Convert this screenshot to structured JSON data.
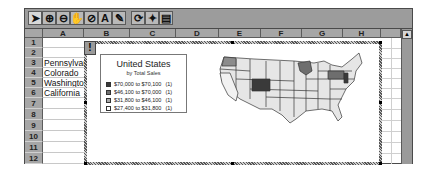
{
  "toolbar": {
    "tools": [
      {
        "name": "select-arrow-icon",
        "glyph": "➤"
      },
      {
        "name": "zoom-in-icon",
        "glyph": "⊕"
      },
      {
        "name": "zoom-out-icon",
        "glyph": "⊖"
      },
      {
        "name": "grabber-hand-icon",
        "glyph": "✋"
      },
      {
        "name": "center-map-icon",
        "glyph": "⊘"
      },
      {
        "name": "text-label-icon",
        "glyph": "A"
      },
      {
        "name": "pin-marker-icon",
        "glyph": "✎"
      },
      {
        "name": "redraw-map-icon",
        "glyph": "⟳"
      },
      {
        "name": "map-refresh-icon",
        "glyph": "✦"
      },
      {
        "name": "show-control-panel-icon",
        "glyph": "▤"
      }
    ]
  },
  "grid": {
    "columns": [
      "A",
      "B",
      "C",
      "D",
      "E",
      "F",
      "G",
      "H"
    ],
    "rows": [
      "1",
      "2",
      "3",
      "4",
      "5",
      "6",
      "7",
      "8",
      "9",
      "10",
      "11",
      "12"
    ],
    "column_a_values": [
      "",
      "",
      "Pennsylvania",
      "Colorado",
      "Washington",
      "California",
      "",
      "",
      "",
      "",
      "",
      ""
    ]
  },
  "chart": {
    "tool_button": "!",
    "legend": {
      "title": "United States",
      "subtitle": "by Total Sales",
      "items": [
        {
          "range": "$70,000 to $70,100",
          "count": "(1)",
          "color": "#3a3a3a"
        },
        {
          "range": "$46,100 to $70,000",
          "count": "(1)",
          "color": "#6e6e6e"
        },
        {
          "range": "$31,800 to $46,100",
          "count": "(1)",
          "color": "#a8a8a8"
        },
        {
          "range": "$27,400 to $31,800",
          "count": "(1)",
          "color": "#ffffff"
        }
      ]
    },
    "map": {
      "region": "United States",
      "shaded_states": {
        "Colorado": "#3a3a3a",
        "Pennsylvania": "#6e6e6e",
        "Washington": "#8c8c8c",
        "California": "#f2f2f2"
      },
      "default_fill": "#e6e6e6"
    }
  },
  "scrollbar": {
    "up_arrow": "▲"
  }
}
